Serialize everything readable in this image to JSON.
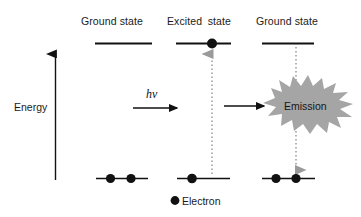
{
  "figure": {
    "type": "energy-level-diagram",
    "background_color": "#ffffff",
    "stroke_color": "#111111",
    "electron_color": "#111111",
    "burst_color": "#a5a5a5",
    "dotted_arrow_color": "#9a9a9a"
  },
  "axis": {
    "label": "Energy",
    "direction": "up"
  },
  "columns": [
    {
      "label": "Ground state"
    },
    {
      "label": "Excited state"
    },
    {
      "label": "Ground state"
    }
  ],
  "stages": [
    {
      "name": "ground-state-initial",
      "label": "Ground state",
      "upper_level_electrons": 0,
      "lower_level_electrons": 2
    },
    {
      "name": "excited-state",
      "label": "Excited state",
      "upper_level_electrons": 1,
      "lower_level_electrons": 1
    },
    {
      "name": "ground-state-final",
      "label": "Ground state",
      "upper_level_electrons": 0,
      "lower_level_electrons": 2
    }
  ],
  "annotations": {
    "photon_label": "hν",
    "emission_label": "Emission",
    "excitation_transition": "upward dotted arrow",
    "relaxation_transition": "downward dotted arrow"
  },
  "legend": {
    "marker": "electron-dot",
    "label": "Electron"
  }
}
